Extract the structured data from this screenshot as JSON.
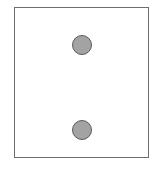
{
  "diagram": {
    "type": "die-face",
    "pip_count": 2,
    "pips": [
      {
        "id": "top",
        "cx": 82,
        "cy": 45,
        "r": 10
      },
      {
        "id": "bottom",
        "cx": 82,
        "cy": 130,
        "r": 10
      }
    ],
    "colors": {
      "border": "#6e6e6e",
      "pip_fill": "#a3a3a3",
      "pip_stroke": "#5a5a5a",
      "background": "#ffffff"
    }
  }
}
